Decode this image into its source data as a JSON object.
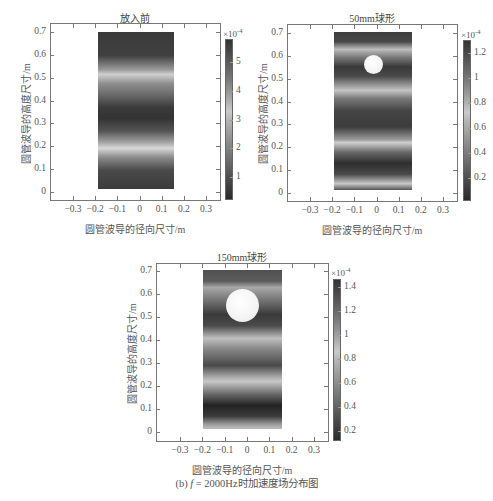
{
  "figure_caption": {
    "prefix": "(b) ",
    "italic_var": "f",
    "suffix": " = 2000Hz时加速度场分布图"
  },
  "chart_data": [
    {
      "type": "heatmap",
      "title": "放入前",
      "xlabel": "圆管波导的径向尺寸/m",
      "ylabel": "圆管波导的高度尺寸/m",
      "xticks": [
        "-0.3",
        "-0.2",
        "-0.1",
        "0",
        "0.1",
        "0.2",
        "0.3"
      ],
      "yticks": [
        "0",
        "0.1",
        "0.2",
        "0.3",
        "0.4",
        "0.5",
        "0.6",
        "0.7"
      ],
      "xlim": [
        -0.38,
        0.38
      ],
      "ylim": [
        -0.03,
        0.73
      ],
      "domain_x": [
        -0.17,
        0.17
      ],
      "domain_y": [
        0.01,
        0.7
      ],
      "colorbar": {
        "exponent": "×10",
        "exponent_power": "-4",
        "ticks": [
          "1",
          "2",
          "3",
          "4",
          "5"
        ],
        "range": [
          0.2,
          5.8
        ]
      },
      "obstacle": null,
      "bands_description": "horizontal standing-wave bands; bright bands near y≈0.18 and y≈0.53, dark bands near y≈0.05, 0.35, 0.65"
    },
    {
      "type": "heatmap",
      "title": "50mm球形",
      "xlabel": "圆管波导的径向尺寸/m",
      "ylabel": "圆管波导的高度尺寸/m",
      "xticks": [
        "-0.3",
        "-0.2",
        "-0.1",
        "0",
        "0.1",
        "0.2",
        "0.3"
      ],
      "yticks": [
        "0",
        "0.1",
        "0.2",
        "0.3",
        "0.4",
        "0.5",
        "0.6",
        "0.7"
      ],
      "xlim": [
        -0.38,
        0.38
      ],
      "ylim": [
        -0.03,
        0.73
      ],
      "domain_x": [
        -0.17,
        0.17
      ],
      "domain_y": [
        0.01,
        0.7
      ],
      "colorbar": {
        "exponent": "×10",
        "exponent_power": "-4",
        "ticks": [
          "0.2",
          "0.4",
          "0.6",
          "0.8",
          "1",
          "1.2"
        ],
        "range": [
          0.02,
          1.3
        ]
      },
      "obstacle": {
        "shape": "sphere",
        "diameter_m": 0.05,
        "center_x": 0.0,
        "center_y": 0.56
      },
      "bands_description": "bright bands near y≈0.62, 0.43, 0.22, 0.03; dark bands near y≈0.67, 0.52, 0.33, 0.12"
    },
    {
      "type": "heatmap",
      "title": "150mm球形",
      "xlabel": "圆管波导的径向尺寸/m",
      "ylabel": "圆管波导的高度尺寸/m",
      "xticks": [
        "-0.3",
        "-0.2",
        "-0.1",
        "0",
        "0.1",
        "0.2",
        "0.3"
      ],
      "yticks": [
        "0",
        "0.1",
        "0.2",
        "0.3",
        "0.4",
        "0.5",
        "0.6",
        "0.7"
      ],
      "xlim": [
        -0.38,
        0.38
      ],
      "ylim": [
        -0.03,
        0.73
      ],
      "domain_x": [
        -0.17,
        0.17
      ],
      "domain_y": [
        0.01,
        0.7
      ],
      "colorbar": {
        "exponent": "×10",
        "exponent_power": "-4",
        "ticks": [
          "0.2",
          "0.4",
          "0.6",
          "0.8",
          "1",
          "1.2",
          "1.4"
        ],
        "range": [
          0.12,
          1.47
        ]
      },
      "obstacle": {
        "shape": "sphere",
        "diameter_m": 0.15,
        "center_x": 0.0,
        "center_y": 0.56
      },
      "bands_description": "bright bands near y≈0.63, 0.39, 0.22, 0.02; dark bands near y≈0.5, 0.3, 0.1"
    }
  ]
}
